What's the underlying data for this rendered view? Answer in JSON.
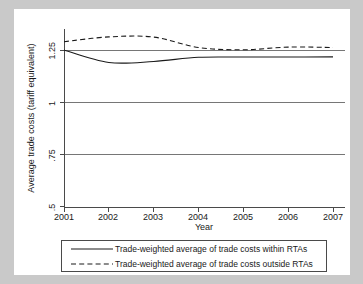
{
  "chart_data": {
    "type": "line",
    "title": "",
    "xlabel": "Year",
    "ylabel": "Average trade costs (tariff equivalent)",
    "x": [
      2001,
      2002,
      2003,
      2004,
      2005,
      2006,
      2007
    ],
    "xticklabels": [
      "2001",
      "2002",
      "2003",
      "2004",
      "2005",
      "2006",
      "2007"
    ],
    "yticklabels": [
      ".5",
      ".75",
      "1",
      "1.25"
    ],
    "yticks": [
      0.5,
      0.75,
      1,
      1.25
    ],
    "ylim": [
      0.5,
      1.34
    ],
    "xlim": [
      2001,
      2007
    ],
    "grid": "horizontal",
    "legend_position": "below-axes",
    "series": [
      {
        "name": "Trade-weighted average of trade costs within RTAs",
        "style": "solid",
        "color": "#1a1a1a",
        "values": [
          1.25,
          1.19,
          1.195,
          1.215,
          1.216,
          1.216,
          1.217
        ]
      },
      {
        "name": "Trade-weighted average of trade costs outside RTAs",
        "style": "dashed",
        "color": "#1a1a1a",
        "values": [
          1.29,
          1.313,
          1.312,
          1.262,
          1.251,
          1.264,
          1.262
        ]
      }
    ]
  },
  "legend": {
    "items": [
      {
        "label": "Trade-weighted average of trade costs within RTAs",
        "style": "solid"
      },
      {
        "label": "Trade-weighted average of trade costs outside RTAs",
        "style": "dashed"
      }
    ]
  },
  "colors": {
    "background": "#c9c9c9",
    "card": "#ffffff",
    "axis": "#4a4a4a",
    "grid": "#767676",
    "text": "#1a1a1a"
  }
}
